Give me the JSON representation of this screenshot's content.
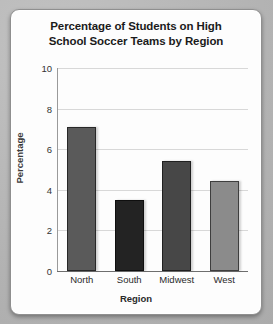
{
  "chart_data": {
    "type": "bar",
    "title": "Percentage of Students on High School Soccer Teams by Region",
    "title_lines": [
      "Percentage of Students on High",
      "School Soccer Teams by Region"
    ],
    "categories": [
      "North",
      "South",
      "Midwest",
      "West"
    ],
    "values": [
      7.1,
      3.5,
      5.4,
      4.45
    ],
    "xlabel": "Region",
    "ylabel": "Percentage",
    "ylim": [
      0,
      10
    ],
    "yticks": [
      0,
      2,
      4,
      6,
      8,
      10
    ],
    "ytick_labels": [
      "0",
      "2",
      "4",
      "6",
      "8",
      "10"
    ],
    "grid": "horizontal",
    "legend": "none",
    "bar_colors": [
      "#5a5a5a",
      "#232323",
      "#474747",
      "#8b8b8b"
    ]
  },
  "colors": {
    "page_background": "#b9b9b9",
    "card_background": "#fdfdfd",
    "card_border": "#8f8f8f",
    "gridline": "#d8d8d8",
    "axis": "#6e6e6e",
    "title_text": "#1b1b1b",
    "tick_text": "#333333"
  }
}
